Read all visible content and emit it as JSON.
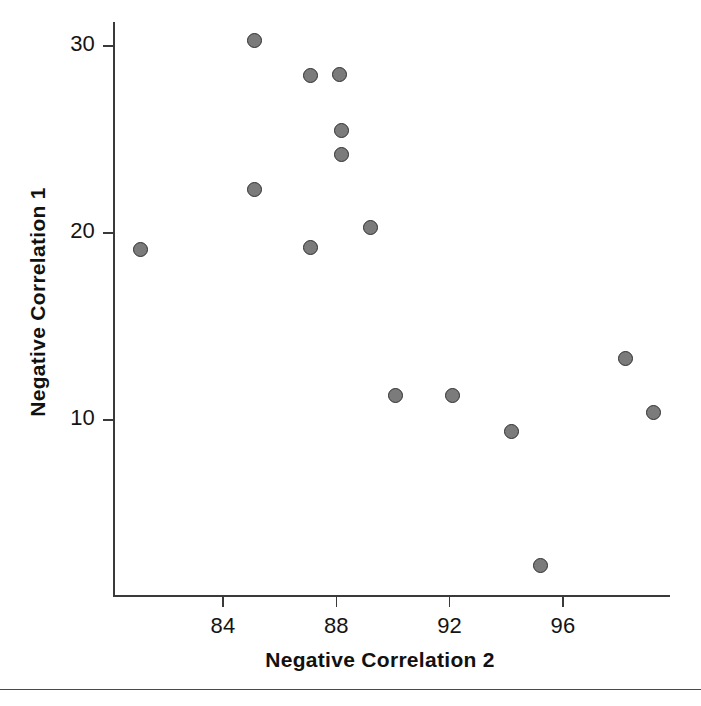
{
  "chart_data": {
    "type": "scatter",
    "title": "",
    "xlabel": "Negative Correlation 2",
    "ylabel": "Negative Correlation 1",
    "xlim": [
      80.5,
      100.2
    ],
    "ylim": [
      1.0,
      31.5
    ],
    "grid": false,
    "legend": null,
    "xticks": [
      84,
      88,
      92,
      96
    ],
    "yticks": [
      10,
      20,
      30
    ],
    "xtick_labels": [
      "84",
      "88",
      "92",
      "96"
    ],
    "ytick_labels": [
      "10",
      "20",
      "30"
    ],
    "marker": {
      "shape": "circle",
      "fill_color": "#7b7b7b",
      "edge_color": "#2f2f2f",
      "size_px": 15
    },
    "points": [
      {
        "x": 81.1,
        "y": 19.1
      },
      {
        "x": 85.1,
        "y": 30.3
      },
      {
        "x": 85.1,
        "y": 22.3
      },
      {
        "x": 87.1,
        "y": 28.4
      },
      {
        "x": 87.1,
        "y": 19.2
      },
      {
        "x": 88.1,
        "y": 28.5
      },
      {
        "x": 88.2,
        "y": 25.5
      },
      {
        "x": 88.2,
        "y": 24.2
      },
      {
        "x": 89.2,
        "y": 20.3
      },
      {
        "x": 90.1,
        "y": 11.3
      },
      {
        "x": 92.1,
        "y": 11.3
      },
      {
        "x": 94.2,
        "y": 9.4
      },
      {
        "x": 95.2,
        "y": 2.2
      },
      {
        "x": 98.2,
        "y": 13.3
      },
      {
        "x": 99.2,
        "y": 10.4
      }
    ]
  },
  "axes": {
    "x_title": "Negative Correlation 2",
    "y_title": "Negative Correlation 1"
  },
  "colors": {
    "axis": "#3a3a3a",
    "text": "#111111",
    "marker_fill": "#7b7b7b",
    "marker_edge": "#2f2f2f",
    "background": "#ffffff"
  }
}
